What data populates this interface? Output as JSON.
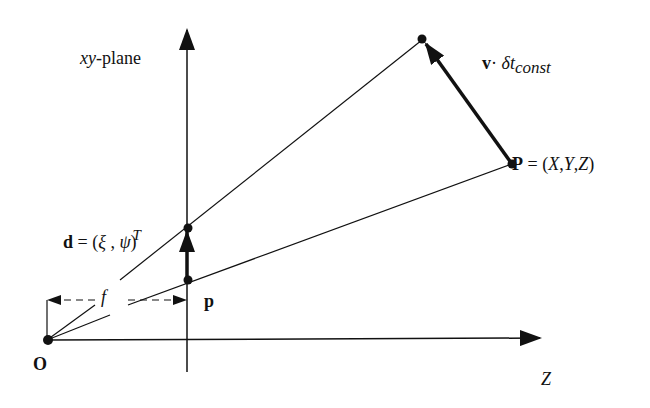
{
  "labels": {
    "xy_plane": {
      "italic": "xy",
      "rest": "-plane"
    },
    "velocity": {
      "bold": "v",
      "dot": "·",
      "delta": " δ",
      "t": "t",
      "sub": "const"
    },
    "point_P": {
      "bold": "P",
      "rest": " = (",
      "X": "X",
      "c1": ",",
      "Y": "Y",
      "c2": ",",
      "Z": "Z",
      "close": ")"
    },
    "d_vector": {
      "bold": "d",
      "rest": " = (",
      "xi": "ξ",
      "sep": " , ",
      "psi": "ψ",
      "close": ")",
      "sup": "T"
    },
    "focal": "f",
    "p": "p",
    "origin": "O",
    "z_axis": "Z"
  },
  "colors": {
    "ink": "#111111",
    "background": "#ffffff"
  }
}
